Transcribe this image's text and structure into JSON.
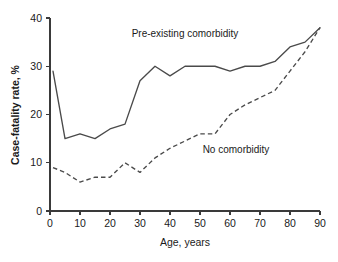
{
  "chart_data": {
    "type": "line",
    "title": "",
    "subtitle": "",
    "xlabel": "Age, years",
    "ylabel": "Case-fatality rate, %",
    "xlim": [
      0,
      90
    ],
    "ylim": [
      0,
      40
    ],
    "xticks": [
      0,
      10,
      20,
      30,
      40,
      50,
      60,
      70,
      80,
      90
    ],
    "yticks": [
      0,
      10,
      20,
      30,
      40
    ],
    "xtick_labels": [
      "0",
      "10",
      "20",
      "30",
      "40",
      "50",
      "60",
      "70",
      "80",
      "90"
    ],
    "ytick_labels": [
      "0",
      "10",
      "20",
      "30",
      "40"
    ],
    "grid": false,
    "legend_position": "inline-annotations",
    "series": [
      {
        "name": "Pre-existing comorbidity",
        "style": "solid",
        "color": "#4a4a4a",
        "x": [
          1,
          5,
          10,
          15,
          20,
          25,
          30,
          35,
          40,
          45,
          50,
          55,
          60,
          65,
          70,
          75,
          80,
          85,
          90
        ],
        "values": [
          29,
          15,
          16,
          15,
          17,
          18,
          27,
          30,
          28,
          30,
          30,
          30,
          29,
          30,
          30,
          31,
          34,
          35,
          38
        ]
      },
      {
        "name": "No comorbidity",
        "style": "dashed",
        "color": "#4a4a4a",
        "x": [
          1,
          5,
          10,
          15,
          20,
          25,
          30,
          35,
          40,
          45,
          50,
          55,
          60,
          65,
          70,
          75,
          80,
          85,
          90
        ],
        "values": [
          9,
          8,
          6,
          7,
          7,
          10,
          8,
          11,
          13,
          14.5,
          16,
          16,
          20,
          22,
          23.5,
          25,
          29,
          33,
          38
        ]
      }
    ],
    "annotations": [
      {
        "text": "Pre-existing comorbidity",
        "x": 45,
        "y": 36
      },
      {
        "text": "No comorbidity",
        "x": 62,
        "y": 12
      }
    ]
  }
}
